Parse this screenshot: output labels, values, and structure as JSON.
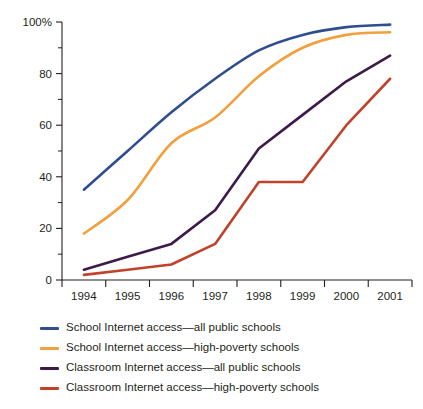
{
  "chart_data": {
    "type": "line",
    "title": "",
    "subtitle": "",
    "xlabel": "Year",
    "ylabel": "",
    "x": [
      1994,
      1995,
      1996,
      1997,
      1998,
      1999,
      2000,
      2001
    ],
    "categories": [
      "1994",
      "1995",
      "1996",
      "1997",
      "1998",
      "1999",
      "2000",
      "2001"
    ],
    "xlim": [
      1993.5,
      2001.5
    ],
    "ylim": [
      0,
      100
    ],
    "yticks": [
      0,
      20,
      40,
      60,
      80,
      100
    ],
    "ytick_labels": [
      "0",
      "20",
      "40",
      "60",
      "80",
      "100%"
    ],
    "yminor_ticks": [
      10,
      30,
      50,
      70,
      90
    ],
    "grid": false,
    "legend_position": "below",
    "series": [
      {
        "name": "School Internet access—all public schools",
        "color": "#2e4e8f",
        "values": [
          35,
          50,
          65,
          78,
          89,
          95,
          98,
          99
        ]
      },
      {
        "name": "School Internet access—high-poverty schools",
        "color": "#f0a03c",
        "values": [
          18,
          31,
          53,
          63,
          79,
          90,
          95,
          96
        ]
      },
      {
        "name": "Classroom Internet access—all public schools",
        "color": "#3d1a4a",
        "values": [
          4,
          9,
          14,
          27,
          51,
          64,
          77,
          87
        ]
      },
      {
        "name": "Classroom Internet access—high-poverty schools",
        "color": "#c0422a",
        "values": [
          2,
          4,
          6,
          14,
          38,
          38,
          60,
          78
        ]
      }
    ]
  },
  "axes": {
    "x_axis_title": "Year",
    "y_axis_tick_labels": [
      "100%",
      "80",
      "60",
      "40",
      "20",
      "0"
    ],
    "x_axis_tick_labels": [
      "1994",
      "1995",
      "1996",
      "1997",
      "1998",
      "1999",
      "2000",
      "2001"
    ]
  },
  "legend": {
    "items": [
      {
        "label": "School Internet access—all public schools",
        "color": "#2e4e8f"
      },
      {
        "label": "School Internet access—high-poverty schools",
        "color": "#f0a03c"
      },
      {
        "label": "Classroom Internet access—all public schools",
        "color": "#3d1a4a"
      },
      {
        "label": "Classroom Internet access—high-poverty schools",
        "color": "#c0422a"
      }
    ]
  }
}
